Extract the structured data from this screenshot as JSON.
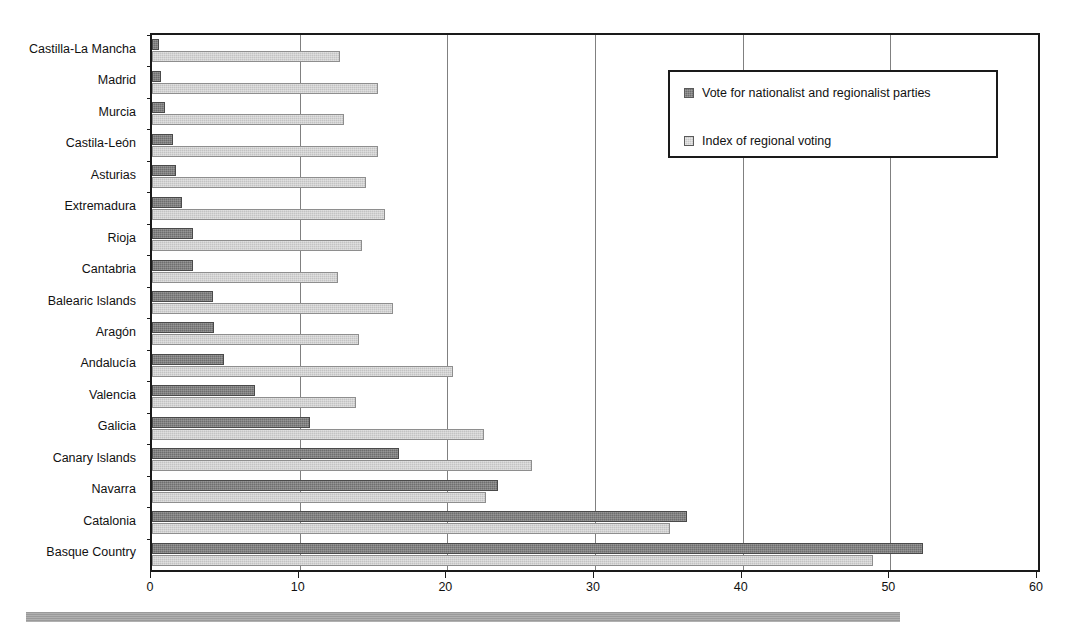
{
  "chart_data": {
    "type": "bar",
    "orientation": "horizontal",
    "title": "",
    "xlabel": "",
    "ylabel": "",
    "xlim": [
      0,
      60
    ],
    "xticks": [
      0,
      10,
      20,
      30,
      40,
      50,
      60
    ],
    "xticklabels": [
      "0",
      "10",
      "20",
      "30",
      "40",
      "50",
      "60"
    ],
    "grid": true,
    "grid_axis": "x",
    "legend_position": "upper right",
    "categories": [
      "Castilla-La Mancha",
      "Madrid",
      "Murcia",
      "Castila-León",
      "Asturias",
      "Extremadura",
      "Rioja",
      "Cantabria",
      "Balearic Islands",
      "Aragón",
      "Andalucía",
      "Valencia",
      "Galicia",
      "Canary Islands",
      "Navarra",
      "Catalonia",
      "Basque Country"
    ],
    "series": [
      {
        "name": "Vote for nationalist and regionalist parties",
        "color": "#6e6e6e",
        "values": [
          0.5,
          0.6,
          0.9,
          1.4,
          1.6,
          2.0,
          2.8,
          2.8,
          4.1,
          4.2,
          4.9,
          7.0,
          10.7,
          16.7,
          23.4,
          36.2,
          52.2
        ]
      },
      {
        "name": "Index of regional voting",
        "color": "#c3c3c3",
        "values": [
          12.7,
          15.3,
          13.0,
          15.3,
          14.5,
          15.8,
          14.2,
          12.6,
          16.3,
          14.0,
          20.4,
          13.8,
          22.5,
          25.7,
          22.6,
          35.1,
          48.8
        ]
      }
    ]
  },
  "legend": {
    "items": [
      {
        "label": "Vote for nationalist and regionalist parties",
        "swatch": "dark-swatch"
      },
      {
        "label": "Index of regional voting",
        "swatch": "light-swatch"
      }
    ]
  }
}
